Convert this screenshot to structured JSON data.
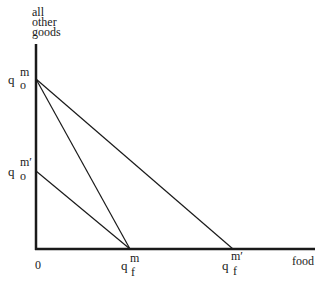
{
  "diagram": {
    "y_axis_label": [
      "all",
      "other",
      "goods"
    ],
    "x_axis_label": "food",
    "origin_label": "0",
    "y_intercepts": [
      {
        "base": "q",
        "sup": "m",
        "sub": "o"
      },
      {
        "base": "q",
        "sup": "m′",
        "sub": "o"
      }
    ],
    "x_intercepts": [
      {
        "base": "q",
        "sup": "m",
        "sub": "f"
      },
      {
        "base": "q",
        "sup": "m′",
        "sub": "f"
      }
    ],
    "lines": [
      {
        "name": "budget-line-qom-to-qfm",
        "from": "q_o^m",
        "to": "q_f^m"
      },
      {
        "name": "budget-line-qom-to-qfm-prime",
        "from": "q_o^m",
        "to": "q_f^m'"
      },
      {
        "name": "budget-line-qom-prime-to-qfm",
        "from": "q_o^m'",
        "to": "q_f^m"
      }
    ],
    "colors": {
      "axis": "#1a1a1a",
      "line": "#1a1a1a",
      "background": "#ffffff"
    }
  }
}
